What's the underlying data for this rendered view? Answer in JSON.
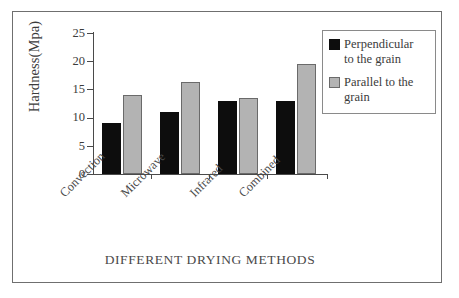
{
  "chart_data": {
    "type": "bar",
    "title": "",
    "xlabel": "DIFFERENT DRYING METHODS",
    "ylabel": "Hardness(Mpa)",
    "categories": [
      "Convection",
      "Microwave",
      "Infrared",
      "Combined"
    ],
    "series": [
      {
        "name": "Perpendicular to the grain",
        "color": "#0d0d0d",
        "values": [
          9.0,
          11.0,
          12.9,
          12.9
        ]
      },
      {
        "name": "Parallel to the grain",
        "color": "#b3b3b3",
        "values": [
          14.1,
          16.3,
          13.5,
          19.5
        ]
      }
    ],
    "ylim": [
      0,
      25
    ],
    "yticks": [
      0,
      5,
      10,
      15,
      20,
      25
    ],
    "ytick_labels": [
      "0",
      "5",
      "10",
      "15",
      "20",
      "25"
    ],
    "grid": false,
    "legend_position": "top-right"
  },
  "legend": {
    "items": [
      {
        "label_line1": "Perpendicular",
        "label_line2": "to the grain",
        "swatch": "dark-square-swatch"
      },
      {
        "label_line1": "Parallel to the",
        "label_line2": "grain",
        "swatch": "light-square-swatch"
      }
    ]
  },
  "colors": {
    "dark_series": "#0d0d0d",
    "light_series": "#b3b3b3",
    "axis": "#4a4a4a",
    "frame": "#6f6f6f",
    "text": "#3b3b3b",
    "background": "#ffffff"
  }
}
